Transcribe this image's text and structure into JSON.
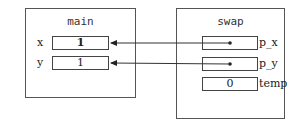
{
  "frames": {
    "main": {
      "title": "main",
      "vars": [
        {
          "name": "x",
          "value": "1"
        },
        {
          "name": "y",
          "value": "1"
        }
      ]
    },
    "swap": {
      "title": "swap",
      "vars": [
        {
          "name": "p_x",
          "value": ""
        },
        {
          "name": "p_y",
          "value": ""
        },
        {
          "name": "temp",
          "value": "0"
        }
      ]
    }
  },
  "arrows": [
    {
      "from": "swap.p_x",
      "to": "main.x"
    },
    {
      "from": "swap.p_y",
      "to": "main.y"
    }
  ]
}
